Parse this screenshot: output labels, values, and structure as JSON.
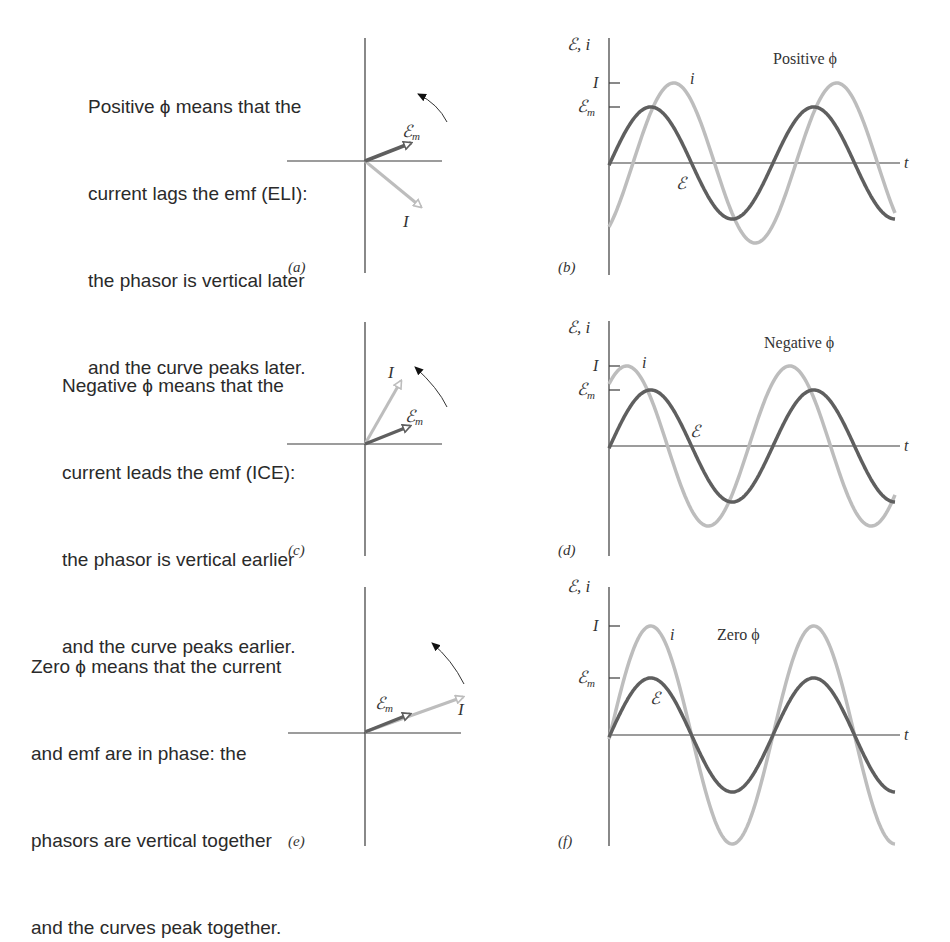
{
  "rows": [
    {
      "id": "positive",
      "description_lines": [
        "Positive ϕ means that the",
        "current lags the emf (ELI):",
        "the phasor is vertical later",
        "and the curve peaks later."
      ],
      "phasor_label": "(a)",
      "chart_label": "(b)",
      "chart_title": "Positive ϕ",
      "phase_px": 23
    },
    {
      "id": "negative",
      "description_lines": [
        "Negative ϕ means that the",
        "current leads the emf (ICE):",
        "the phasor is vertical earlier",
        "and the curve peaks earlier."
      ],
      "phasor_label": "(c)",
      "chart_label": "(d)",
      "chart_title": "Negative ϕ",
      "phase_px": -24
    },
    {
      "id": "zero",
      "description_lines": [
        "Zero ϕ means that the current",
        "and emf are in phase: the",
        "phasors are vertical together",
        "and the curves peak together."
      ],
      "phasor_label": "(e)",
      "chart_label": "(f)",
      "chart_title": "Zero ϕ",
      "phase_px": 0
    }
  ],
  "labels": {
    "y_axis": "ℰ, i",
    "t_axis": "t",
    "tick_I": "I",
    "tick_Em": "ℰ",
    "tick_Em_sub": "m",
    "curve_i": "i",
    "curve_E": "ℰ",
    "phasor_Em": "ℰ",
    "phasor_Em_sub": "m",
    "phasor_I": "I"
  },
  "colors": {
    "emf_curve": "#5f5f5f",
    "current_curve": "#bdbdbd",
    "axis": "#3a3a3a",
    "text": "#2a2a2a"
  },
  "chart_data": [
    {
      "type": "line",
      "title": "Positive ϕ",
      "xlabel": "t",
      "ylabel": "ℰ, i",
      "yticks": [
        "ℰm",
        "I"
      ],
      "series": [
        {
          "name": "ℰ",
          "function": "ℰm sin(ωt)",
          "amplitude": "ℰm",
          "relative_amplitude": 0.7
        },
        {
          "name": "i",
          "function": "I sin(ωt − ϕ)",
          "amplitude": "I",
          "relative_amplitude": 1.0,
          "phase_deg": 51
        }
      ],
      "x_range_cycles": [
        0,
        1.75
      ]
    },
    {
      "type": "line",
      "title": "Negative ϕ",
      "xlabel": "t",
      "ylabel": "ℰ, i",
      "yticks": [
        "ℰm",
        "I"
      ],
      "series": [
        {
          "name": "ℰ",
          "function": "ℰm sin(ωt)",
          "amplitude": "ℰm",
          "relative_amplitude": 0.7
        },
        {
          "name": "i",
          "function": "I sin(ωt − ϕ)",
          "amplitude": "I",
          "relative_amplitude": 1.0,
          "phase_deg": -53
        }
      ],
      "x_range_cycles": [
        0,
        1.75
      ]
    },
    {
      "type": "line",
      "title": "Zero ϕ",
      "xlabel": "t",
      "ylabel": "ℰ, i",
      "yticks": [
        "ℰm",
        "I"
      ],
      "series": [
        {
          "name": "ℰ",
          "function": "ℰm sin(ωt)",
          "amplitude": "ℰm",
          "relative_amplitude": 0.52
        },
        {
          "name": "i",
          "function": "I sin(ωt)",
          "amplitude": "I",
          "relative_amplitude": 1.0,
          "phase_deg": 0
        }
      ],
      "x_range_cycles": [
        0,
        1.75
      ]
    }
  ]
}
